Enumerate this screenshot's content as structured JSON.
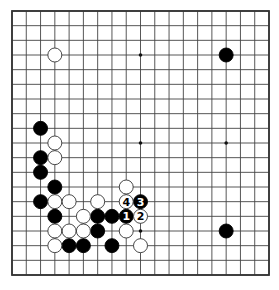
{
  "board": {
    "size": 19,
    "left": 12,
    "top": 11,
    "right": 269,
    "bottom": 275,
    "line_color": "#444444",
    "border_color": "#333333",
    "background": "#ffffff",
    "stone_radius": 7,
    "star_points": [
      [
        3,
        3
      ],
      [
        9,
        3
      ],
      [
        15,
        3
      ],
      [
        3,
        9
      ],
      [
        9,
        9
      ],
      [
        15,
        9
      ],
      [
        3,
        15
      ],
      [
        9,
        15
      ],
      [
        15,
        15
      ]
    ]
  },
  "stones": {
    "black": [
      {
        "col": 15,
        "row": 3
      },
      {
        "col": 2,
        "row": 8
      },
      {
        "col": 2,
        "row": 10
      },
      {
        "col": 2,
        "row": 11
      },
      {
        "col": 3,
        "row": 12
      },
      {
        "col": 2,
        "row": 13
      },
      {
        "col": 3,
        "row": 14
      },
      {
        "col": 6,
        "row": 14
      },
      {
        "col": 7,
        "row": 14
      },
      {
        "col": 8,
        "row": 14,
        "label": "1"
      },
      {
        "col": 9,
        "row": 13,
        "label": "3"
      },
      {
        "col": 6,
        "row": 15
      },
      {
        "col": 4,
        "row": 16
      },
      {
        "col": 5,
        "row": 16
      },
      {
        "col": 7,
        "row": 16
      },
      {
        "col": 15,
        "row": 15
      }
    ],
    "white": [
      {
        "col": 3,
        "row": 3
      },
      {
        "col": 3,
        "row": 9
      },
      {
        "col": 3,
        "row": 10
      },
      {
        "col": 3,
        "row": 13
      },
      {
        "col": 4,
        "row": 13
      },
      {
        "col": 6,
        "row": 13
      },
      {
        "col": 8,
        "row": 12
      },
      {
        "col": 8,
        "row": 13,
        "label": "4"
      },
      {
        "col": 5,
        "row": 14
      },
      {
        "col": 9,
        "row": 14,
        "label": "2"
      },
      {
        "col": 3,
        "row": 15
      },
      {
        "col": 4,
        "row": 15
      },
      {
        "col": 5,
        "row": 15
      },
      {
        "col": 8,
        "row": 15
      },
      {
        "col": 3,
        "row": 16
      },
      {
        "col": 9,
        "row": 16
      }
    ]
  },
  "move_sequence": [
    "1",
    "2",
    "3",
    "4"
  ]
}
